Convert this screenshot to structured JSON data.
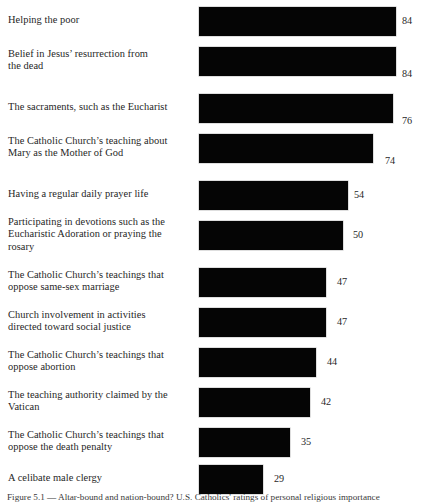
{
  "figure": {
    "caption": "Figure 5.1 — Altar-bound and nation-bound? U.S. Catholics' ratings of personal religious importance"
  },
  "chart_data": {
    "type": "bar",
    "title": "",
    "subtitle": "",
    "xlabel": "",
    "ylabel": "",
    "orientation": "horizontal",
    "grid": false,
    "legend": "none",
    "xlim": [
      0,
      100
    ],
    "value_suffix": "",
    "categories": [
      "Helping the poor",
      "Belief in Jesus’ resurrection from the dead",
      "The sacraments, such as the Eucharist",
      "The Catholic Church’s teaching about Mary as the Mother of God",
      "Having a regular daily prayer life",
      "Participating in devotions such as the Eucharistic Adoration or praying the rosary",
      "The Catholic Church’s teachings that oppose same-sex marriage",
      "Church involvement in activities directed toward social justice",
      "The Catholic Church’s teachings that oppose abortion",
      "The teaching authority claimed by the Vatican",
      "The Catholic Church’s teachings that oppose the death penalty",
      "A celibate male clergy"
    ],
    "values": [
      84,
      84,
      76,
      74,
      54,
      50,
      47,
      47,
      44,
      42,
      35,
      29
    ],
    "rows": [
      {
        "label_lines": [
          "Helping the poor"
        ],
        "value": 84,
        "value_text": "84",
        "bar_px": 197,
        "value_left_px": 402,
        "value_pos": "mid"
      },
      {
        "label_lines": [
          "Belief in Jesus’ resurrection from",
          "the dead"
        ],
        "value": 84,
        "value_text": "84",
        "bar_px": 197,
        "value_left_px": 402,
        "value_pos": "low"
      },
      {
        "label_lines": [
          "The sacraments, such as the Eucharist"
        ],
        "value": 76,
        "value_text": "76",
        "bar_px": 194,
        "value_left_px": 402,
        "value_pos": "low"
      },
      {
        "label_lines": [
          "The Catholic Church’s teaching about",
          "Mary as the Mother of God"
        ],
        "value": 74,
        "value_text": "74",
        "bar_px": 174,
        "value_left_px": 385,
        "value_pos": "low"
      },
      {
        "label_lines": [
          "Having a regular daily prayer life"
        ],
        "value": 54,
        "value_text": "54",
        "bar_px": 149,
        "value_left_px": 354,
        "value_pos": "mid"
      },
      {
        "label_lines": [
          "Participating in devotions such as the",
          "Eucharistic Adoration or praying the",
          "rosary"
        ],
        "value": 50,
        "value_text": "50",
        "bar_px": 144,
        "value_left_px": 353,
        "value_pos": "mid"
      },
      {
        "label_lines": [
          "The Catholic Church’s teachings that",
          "oppose same-sex marriage"
        ],
        "value": 47,
        "value_text": "47",
        "bar_px": 127,
        "value_left_px": 337,
        "value_pos": "mid"
      },
      {
        "label_lines": [
          "Church involvement in activities",
          "directed toward social justice"
        ],
        "value": 47,
        "value_text": "47",
        "bar_px": 127,
        "value_left_px": 337,
        "value_pos": "mid"
      },
      {
        "label_lines": [
          "The Catholic Church’s teachings that",
          "oppose abortion"
        ],
        "value": 44,
        "value_text": "44",
        "bar_px": 117,
        "value_left_px": 327,
        "value_pos": "mid"
      },
      {
        "label_lines": [
          "The teaching authority claimed by the",
          "Vatican"
        ],
        "value": 42,
        "value_text": "42",
        "bar_px": 111,
        "value_left_px": 321,
        "value_pos": "mid"
      },
      {
        "label_lines": [
          "The Catholic Church’s teachings that",
          "oppose the death penalty"
        ],
        "value": 35,
        "value_text": "35",
        "bar_px": 91,
        "value_left_px": 301,
        "value_pos": "mid"
      },
      {
        "label_lines": [
          "A celibate male clergy"
        ],
        "value": 29,
        "value_text": "29",
        "bar_px": 64,
        "value_left_px": 274,
        "value_pos": "mid"
      }
    ],
    "row_tops_px": [
      1,
      41,
      88,
      128,
      175,
      215,
      262,
      302,
      342,
      382,
      422,
      459
    ]
  }
}
